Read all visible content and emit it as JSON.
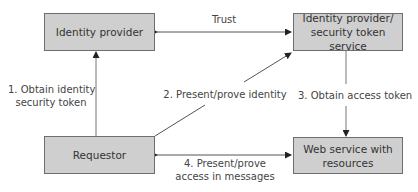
{
  "nodes": {
    "identity_provider": {
      "label": "Identity provider"
    },
    "sts": {
      "line1": "Identity provider/",
      "line2": "security token service"
    },
    "requestor": {
      "label": "Requestor"
    },
    "web_service": {
      "line1": "Web service with",
      "line2": "resources"
    }
  },
  "edges": {
    "trust": {
      "label": "Trust",
      "direction": "bidirectional"
    },
    "step1": {
      "line1": "1. Obtain identity",
      "line2": "security token",
      "direction": "requestor-to-identity-provider"
    },
    "step2": {
      "label": "2. Present/prove identity",
      "direction": "requestor-to-sts"
    },
    "step3": {
      "label": "3. Obtain access token",
      "direction": "sts-to-web-service"
    },
    "step4": {
      "line1": "4. Present/prove",
      "line2": "access in messages",
      "direction": "bidirectional"
    }
  },
  "colors": {
    "box_fill": "#cfcfcf",
    "box_border": "#6e6e6e",
    "line": "#555555",
    "text": "#3a3a3a"
  }
}
